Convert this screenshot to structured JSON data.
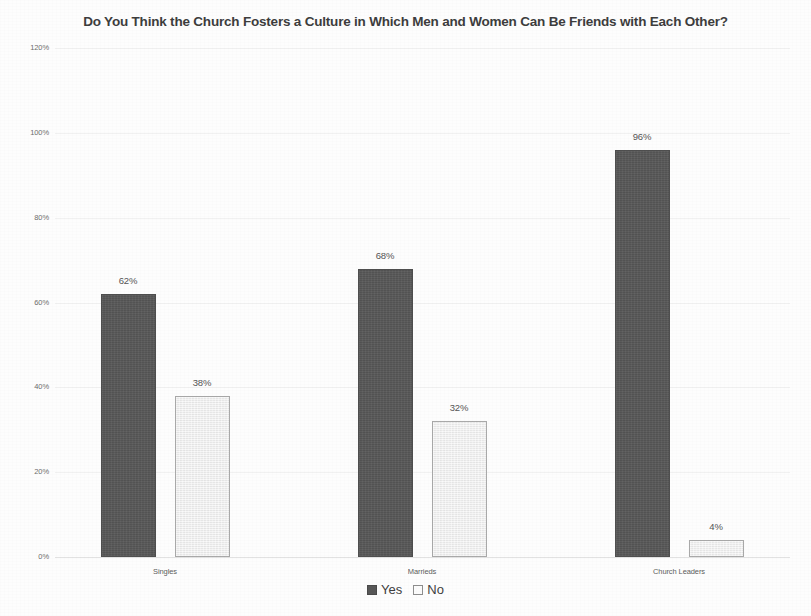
{
  "chart_data": {
    "type": "bar",
    "title": "Do You Think the Church Fosters a Culture in Which Men and Women Can Be Friends with Each Other?",
    "xlabel": "",
    "ylabel": "",
    "ylim": [
      0,
      120
    ],
    "ytick_labels": [
      "0%",
      "20%",
      "40%",
      "60%",
      "80%",
      "100%",
      "120%"
    ],
    "ytick_values": [
      0,
      20,
      40,
      60,
      80,
      100,
      120
    ],
    "grid": true,
    "legend_position": "bottom",
    "categories": [
      "Singles",
      "Marrieds",
      "Church Leaders"
    ],
    "series": [
      {
        "name": "Yes",
        "color": "#585858",
        "values": [
          62,
          68,
          96
        ],
        "labels": [
          "62%",
          "68%",
          "96%"
        ]
      },
      {
        "name": "No",
        "color": "#eeeeee",
        "values": [
          38,
          32,
          4
        ],
        "labels": [
          "38%",
          "32%",
          "4%"
        ]
      }
    ]
  },
  "legend": {
    "items": [
      {
        "label": "Yes",
        "swatch": "dark-square-swatch"
      },
      {
        "label": "No",
        "swatch": "light-square-swatch"
      }
    ]
  }
}
